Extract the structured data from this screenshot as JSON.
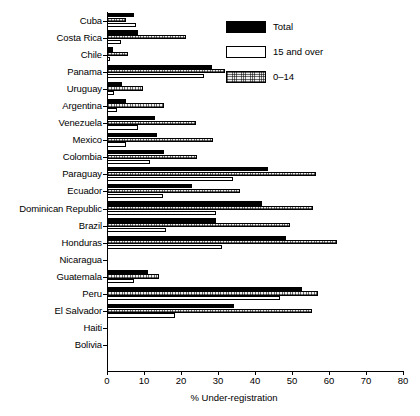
{
  "chart_data": {
    "type": "bar",
    "orientation": "horizontal",
    "title": "",
    "xlabel": "% Under-registration",
    "ylabel": "",
    "xlim": [
      0,
      80
    ],
    "xticks": [
      0,
      10,
      20,
      30,
      40,
      50,
      60,
      70,
      80
    ],
    "grid": false,
    "legend_position": "top-right",
    "categories": [
      "Cuba",
      "Costa Rica",
      "Chile",
      "Panama",
      "Uruguay",
      "Argentina",
      "Venezuela",
      "Mexico",
      "Colombia",
      "Paraguay",
      "Ecuador",
      "Dominican Republic",
      "Brazil",
      "Honduras",
      "Nicaragua",
      "Guatemala",
      "Peru",
      "El Salvador",
      "Haiti",
      "Bolivia"
    ],
    "series": [
      {
        "name": "Total",
        "values": [
          7.3,
          8.4,
          1.6,
          28.4,
          4.1,
          5.2,
          13.0,
          13.5,
          15.4,
          43.5,
          23.0,
          41.9,
          29.5,
          48.4,
          0,
          11.0,
          52.7,
          34.3,
          0,
          0
        ]
      },
      {
        "name": "15 and over",
        "values": [
          7.8,
          3.8,
          0.8,
          26.2,
          1.9,
          2.7,
          8.4,
          5.1,
          11.6,
          34.0,
          15.1,
          29.4,
          16.0,
          31.0,
          0,
          7.3,
          46.8,
          18.4,
          0,
          0
        ]
      },
      {
        "name": "0–14",
        "values": [
          5.1,
          21.4,
          5.7,
          32.0,
          9.7,
          15.4,
          24.0,
          28.6,
          24.2,
          56.6,
          35.9,
          55.8,
          49.4,
          62.2,
          0,
          14.0,
          57.1,
          55.4,
          0,
          0
        ]
      }
    ]
  },
  "legend": {
    "items": [
      {
        "label": "Total",
        "swatch": "black-fill",
        "color": "#000000"
      },
      {
        "label": "15 and over",
        "swatch": "white-fill",
        "color": "#ffffff"
      },
      {
        "label": "0–14",
        "swatch": "hatched-fill",
        "color": "#bfbfbf"
      }
    ]
  }
}
